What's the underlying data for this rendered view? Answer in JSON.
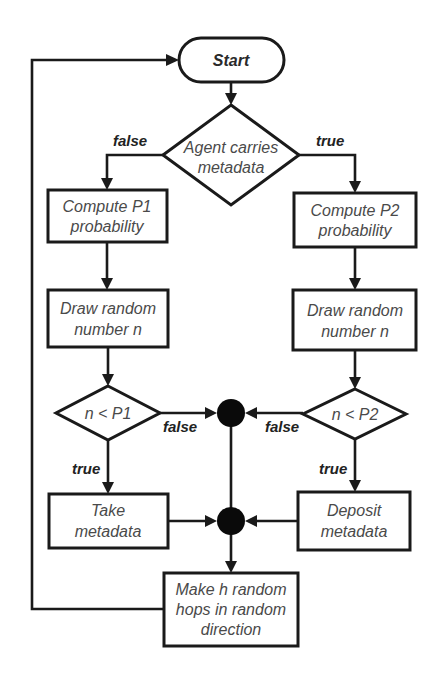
{
  "diagram": {
    "type": "flowchart",
    "colors": {
      "background": "#ffffff",
      "stroke": "#1a1a1a",
      "node_text": "#4a4a4a",
      "edge_label": "#222222",
      "junction": "#0a0a0a"
    },
    "nodes": {
      "start": {
        "label": "Start",
        "shape": "terminator"
      },
      "agent_check": {
        "lines": [
          "Agent carries",
          "metadata"
        ],
        "shape": "decision"
      },
      "compute_p1": {
        "lines": [
          "Compute P1",
          "probability"
        ],
        "shape": "process"
      },
      "compute_p2": {
        "lines": [
          "Compute P2",
          "probability"
        ],
        "shape": "process"
      },
      "draw_left": {
        "lines": [
          "Draw random",
          "number n"
        ],
        "shape": "process"
      },
      "draw_right": {
        "lines": [
          "Draw random",
          "number n"
        ],
        "shape": "process"
      },
      "check_p1": {
        "label": "n < P1",
        "shape": "decision"
      },
      "check_p2": {
        "label": "n < P2",
        "shape": "decision"
      },
      "take": {
        "lines": [
          "Take",
          "metadata"
        ],
        "shape": "process"
      },
      "deposit": {
        "lines": [
          "Deposit",
          "metadata"
        ],
        "shape": "process"
      },
      "hops": {
        "lines": [
          "Make h random",
          "hops in random",
          "direction"
        ],
        "shape": "process"
      }
    },
    "edge_labels": {
      "agent_false": "false",
      "agent_true": "true",
      "p1_false": "false",
      "p2_false": "false",
      "p1_true": "true",
      "p2_true": "true"
    },
    "edges": [
      {
        "from": "start",
        "to": "agent_check"
      },
      {
        "from": "agent_check",
        "to": "compute_p1",
        "label": "false"
      },
      {
        "from": "agent_check",
        "to": "compute_p2",
        "label": "true"
      },
      {
        "from": "compute_p1",
        "to": "draw_left"
      },
      {
        "from": "compute_p2",
        "to": "draw_right"
      },
      {
        "from": "draw_left",
        "to": "check_p1"
      },
      {
        "from": "draw_right",
        "to": "check_p2"
      },
      {
        "from": "check_p1",
        "to": "junction_top",
        "label": "false"
      },
      {
        "from": "check_p2",
        "to": "junction_top",
        "label": "false"
      },
      {
        "from": "check_p1",
        "to": "take",
        "label": "true"
      },
      {
        "from": "check_p2",
        "to": "deposit",
        "label": "true"
      },
      {
        "from": "junction_top",
        "to": "junction_bottom"
      },
      {
        "from": "take",
        "to": "junction_bottom"
      },
      {
        "from": "deposit",
        "to": "junction_bottom"
      },
      {
        "from": "junction_bottom",
        "to": "hops"
      },
      {
        "from": "hops",
        "to": "start"
      }
    ]
  }
}
